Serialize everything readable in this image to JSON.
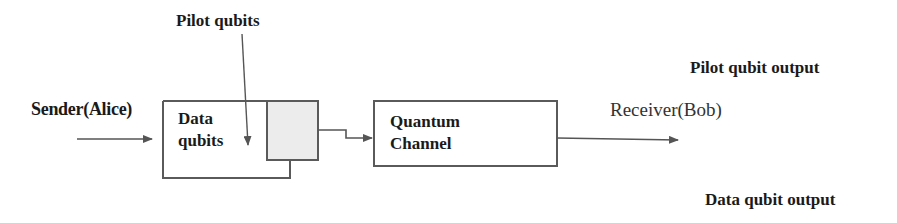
{
  "diagram": {
    "sender_label": "Sender(Alice)",
    "receiver_label": "Receiver(Bob)",
    "pilot_input_label": "Pilot qubits",
    "data_box": {
      "line1": "Data",
      "line2": "qubits"
    },
    "channel_box": {
      "line1": "Quantum",
      "line2": "Channel"
    },
    "outputs": {
      "pilot": "Pilot qubit output",
      "data": "Data qubit output"
    },
    "colors": {
      "line": "#555555",
      "pilot_block_fill": "#ececec",
      "text": "#1a1a1a"
    },
    "edges": [
      {
        "from": "Sender(Alice)",
        "to": "Data qubits"
      },
      {
        "from": "Pilot qubits",
        "to": "Data qubits"
      },
      {
        "from": "Data qubits + pilot block",
        "to": "Quantum Channel"
      },
      {
        "from": "Quantum Channel",
        "to": "Receiver(Bob)"
      }
    ]
  }
}
